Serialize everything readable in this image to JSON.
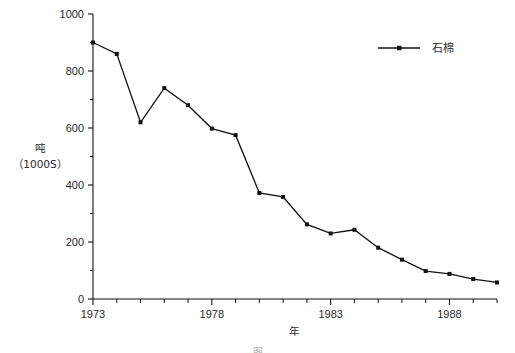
{
  "chart_data": {
    "type": "line",
    "title": "",
    "xlabel": "年",
    "ylabel": "吨",
    "ylabel_sub": "（1000S）",
    "xlim": [
      1973,
      1990
    ],
    "ylim": [
      0,
      1000
    ],
    "grid": false,
    "legend_position": "top-right",
    "x": [
      1973,
      1974,
      1975,
      1976,
      1977,
      1978,
      1979,
      1980,
      1981,
      1982,
      1983,
      1984,
      1985,
      1986,
      1987,
      1988,
      1989,
      1990
    ],
    "series": [
      {
        "name": "石棉",
        "marker": "square",
        "color": "#111111",
        "values": [
          900,
          860,
          620,
          740,
          680,
          598,
          575,
          372,
          358,
          262,
          230,
          243,
          180,
          138,
          98,
          88,
          70,
          58
        ]
      }
    ],
    "y_ticks": [
      0,
      200,
      400,
      600,
      800,
      1000
    ],
    "y_tick_labels": [
      "0",
      "200",
      "400",
      "600",
      "800",
      "1000"
    ],
    "y_minor_ticks": [
      100,
      300,
      500,
      700,
      900
    ],
    "x_ticks": [
      1973,
      1974,
      1975,
      1976,
      1977,
      1978,
      1979,
      1980,
      1981,
      1982,
      1983,
      1984,
      1985,
      1986,
      1987,
      1988,
      1989,
      1990
    ],
    "x_tick_labels": [
      "1973",
      "1978",
      "1983",
      "1988"
    ],
    "x_labeled_ticks": [
      1973,
      1978,
      1983,
      1988
    ]
  },
  "legend": {
    "entries": [
      {
        "label": "石棉"
      }
    ]
  },
  "axes": {
    "y_title_line1": "吨",
    "y_title_line2": "（1000S）",
    "x_title": "年"
  },
  "caption": {
    "text": "图"
  },
  "colors": {
    "ink": "#111111",
    "text": "#2a2a2a",
    "background": "#ffffff"
  }
}
